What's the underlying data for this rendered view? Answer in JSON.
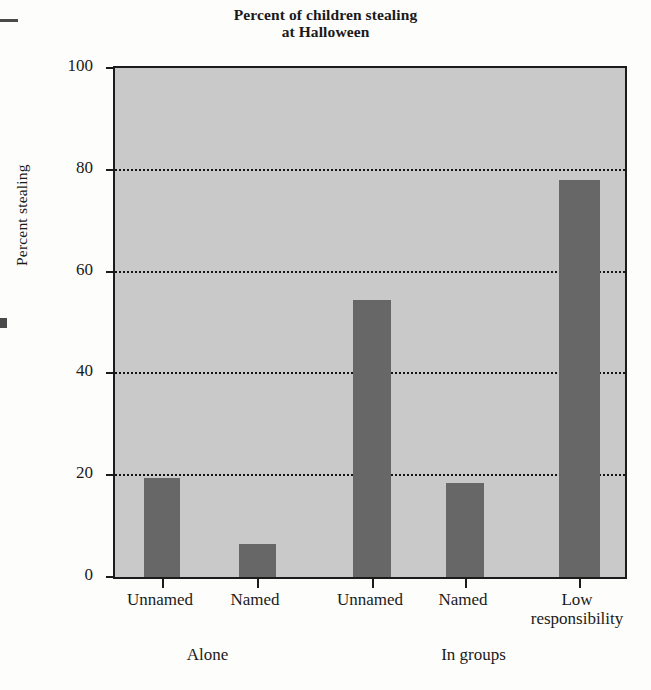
{
  "chart_data": {
    "type": "bar",
    "title": "Percent of children stealing at Halloween",
    "title_line1": "Percent of children stealing",
    "title_line2": "at Halloween",
    "xlabel": "",
    "ylabel": "Percent stealing",
    "ylim": [
      0,
      100
    ],
    "yticks": [
      0,
      20,
      40,
      60,
      80,
      100
    ],
    "grid": "horizontal-dotted",
    "legend": "none",
    "categories": [
      "Unnamed",
      "Named",
      "Unnamed",
      "Named",
      "Low responsibility"
    ],
    "values": [
      19.5,
      6.5,
      54.5,
      18.5,
      78
    ],
    "groups": [
      {
        "label": "Alone",
        "categories": [
          "Unnamed",
          "Named"
        ]
      },
      {
        "label": "In groups",
        "categories": [
          "Unnamed",
          "Named",
          "Low responsibility"
        ]
      }
    ],
    "bars": [
      {
        "label": "Unnamed",
        "label_line2": "",
        "group": "Alone",
        "value": 19.5
      },
      {
        "label": "Named",
        "label_line2": "",
        "group": "Alone",
        "value": 6.5
      },
      {
        "label": "Unnamed",
        "label_line2": "",
        "group": "In groups",
        "value": 54.5
      },
      {
        "label": "Named",
        "label_line2": "",
        "group": "In groups",
        "value": 18.5
      },
      {
        "label": "Low",
        "label_line2": "responsibility",
        "group": "In groups",
        "value": 78
      }
    ],
    "colors": {
      "bar_fill": "#676767",
      "plot_background": "#c9c9c9",
      "axis": "#1b1b1b",
      "gridline": "#141414",
      "page_background": "#fdfdfb",
      "text": "#1a1a1a"
    }
  },
  "ytick_labels": [
    "0",
    "20",
    "40",
    "60",
    "80",
    "100"
  ]
}
